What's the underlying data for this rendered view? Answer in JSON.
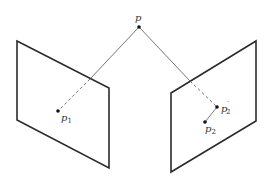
{
  "diagram": {
    "type": "two-view epipolar geometry",
    "point_3d": {
      "label": "p",
      "x": 139,
      "y": 27,
      "label_x": 136,
      "label_y": 21
    },
    "left_plane": {
      "corners": [
        [
          17,
          41
        ],
        [
          109,
          88
        ],
        [
          109,
          168
        ],
        [
          17,
          120
        ]
      ],
      "ray_exit": [
        90,
        79
      ],
      "projection": {
        "label": "p",
        "subscript": "1",
        "x": 58,
        "y": 111,
        "label_x": 62,
        "label_y": 121
      }
    },
    "right_plane": {
      "corners": [
        [
          171,
          93
        ],
        [
          256,
          41
        ],
        [
          256,
          121
        ],
        [
          171,
          172
        ]
      ],
      "ray_exit": [
        190,
        81
      ],
      "projection_prime": {
        "label": "p",
        "subscript": "2",
        "superscript": "′",
        "x": 217,
        "y": 107,
        "label_x": 222,
        "label_y": 112
      },
      "projection": {
        "label": "p",
        "subscript": "2",
        "x": 205,
        "y": 122,
        "label_x": 206,
        "label_y": 132
      }
    },
    "colors": {
      "plane_stroke": "#2b2b2b",
      "ray": "#555555",
      "point": "#111111",
      "label": "#333333"
    }
  },
  "labels": {
    "p": "p",
    "p1_base": "p",
    "p1_sub": "1",
    "p2prime_base": "p",
    "p2prime_sub": "2",
    "p2prime_sup": "′",
    "p2_base": "p",
    "p2_sub": "2"
  }
}
